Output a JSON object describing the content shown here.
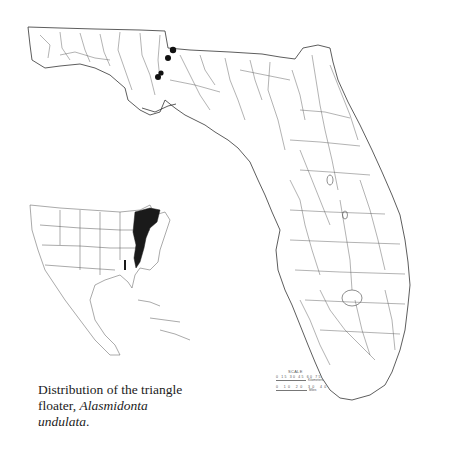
{
  "figure": {
    "type": "species distribution map",
    "caption": {
      "line1": "Distribution of the triangle",
      "line2_plain": "floater, ",
      "line2_italic": "Alasmidonta",
      "line3_italic": "undulata",
      "line3_end": "."
    },
    "main_map": {
      "region": "Florida",
      "features": "rivers, lakes, county boundaries",
      "occurrence_points": [
        {
          "label": "record-1",
          "x": 173,
          "y": 50
        },
        {
          "label": "record-2",
          "x": 168,
          "y": 58
        },
        {
          "label": "record-3",
          "x": 157,
          "y": 76
        },
        {
          "label": "record-4",
          "x": 160,
          "y": 73
        }
      ]
    },
    "inset_map": {
      "region": "North America, Central America and Caribbean",
      "shaded_range": "Atlantic drainages of eastern North America (Nova Scotia to Georgia), plus Apalachicola basin bar"
    },
    "scale": {
      "title": "SCALE",
      "km_ticks": [
        "0",
        "15",
        "30",
        "45",
        "60",
        "75"
      ],
      "km_label": "Kilometers",
      "mi_ticks": [
        "0",
        "10",
        "20",
        "30",
        "40"
      ],
      "mi_label": "Miles"
    },
    "colors": {
      "background": "#ffffff",
      "linework": "#333333",
      "range_fill": "#1a1a1a",
      "points": "#111111"
    }
  }
}
